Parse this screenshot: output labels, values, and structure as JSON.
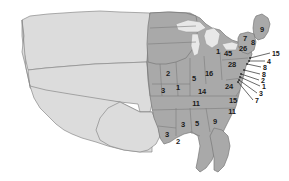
{
  "figure": {
    "type": "choropleth-style outline map",
    "colors": {
      "unlabeled_region_fill": "#dcdcdc",
      "labeled_region_fill": "#a9a9a9",
      "lake_fill": "#e8e8e8",
      "border_stroke": "#787878",
      "outline_stroke": "#6b6b6b",
      "label_text": "#1b1b1b",
      "leader_line": "#2a2a2a",
      "background": "#ffffff"
    }
  },
  "chart_data": {
    "type": "map",
    "title": "",
    "xlabel": "",
    "ylabel": "",
    "legend_position": "none",
    "grid": false,
    "value_label": "count",
    "regions": [
      {
        "name": "midwest-upper",
        "value": "2",
        "x": 168,
        "y": 74
      },
      {
        "name": "plains-lower",
        "value": "3",
        "x": 163,
        "y": 91
      },
      {
        "name": "illinois",
        "value": "1",
        "x": 178,
        "y": 88
      },
      {
        "name": "indiana",
        "value": "5",
        "x": 194,
        "y": 79
      },
      {
        "name": "ohio",
        "value": "16",
        "x": 209,
        "y": 74
      },
      {
        "name": "kentucky",
        "value": "14",
        "x": 202,
        "y": 92
      },
      {
        "name": "tennessee",
        "value": "11",
        "x": 196,
        "y": 104
      },
      {
        "name": "virginia",
        "value": "24",
        "x": 229,
        "y": 87
      },
      {
        "name": "pennsylvania",
        "value": "28",
        "x": 232,
        "y": 65
      },
      {
        "name": "newyork",
        "value": "26",
        "x": 243,
        "y": 49
      },
      {
        "name": "greatlakes-a",
        "value": "1",
        "x": 218,
        "y": 52
      },
      {
        "name": "greatlakes-b",
        "value": "45",
        "x": 228,
        "y": 54
      },
      {
        "name": "northcarolina",
        "value": "15",
        "x": 233,
        "y": 101
      },
      {
        "name": "southcarolina",
        "value": "11",
        "x": 232,
        "y": 112
      },
      {
        "name": "georgia",
        "value": "9",
        "x": 215,
        "y": 122
      },
      {
        "name": "alabama",
        "value": "5",
        "x": 197,
        "y": 124
      },
      {
        "name": "mississippi",
        "value": "3",
        "x": 183,
        "y": 125
      },
      {
        "name": "louisiana",
        "value": "3",
        "x": 167,
        "y": 135
      },
      {
        "name": "gulf-coast",
        "value": "2",
        "x": 178,
        "y": 142
      },
      {
        "name": "maine",
        "value": "9",
        "x": 262,
        "y": 30
      },
      {
        "name": "newhampshire",
        "value": "8",
        "x": 253,
        "y": 43
      },
      {
        "name": "vermont",
        "value": "7",
        "x": 245,
        "y": 39
      }
    ],
    "callouts": [
      {
        "name": "callout-1",
        "value": "15",
        "label_x": 272,
        "label_y": 53,
        "tip_x": 250,
        "tip_y": 58
      },
      {
        "name": "callout-2",
        "value": "4",
        "label_x": 267,
        "label_y": 61,
        "tip_x": 249,
        "tip_y": 61
      },
      {
        "name": "callout-3",
        "value": "8",
        "label_x": 263,
        "label_y": 67,
        "tip_x": 247,
        "tip_y": 64
      },
      {
        "name": "callout-4",
        "value": "8",
        "label_x": 262,
        "label_y": 74,
        "tip_x": 244,
        "tip_y": 70
      },
      {
        "name": "callout-5",
        "value": "2",
        "label_x": 261,
        "label_y": 80,
        "tip_x": 241,
        "tip_y": 74
      },
      {
        "name": "callout-6",
        "value": "1",
        "label_x": 262,
        "label_y": 86,
        "tip_x": 240,
        "tip_y": 77
      },
      {
        "name": "callout-7",
        "value": "3",
        "label_x": 259,
        "label_y": 93,
        "tip_x": 239,
        "tip_y": 80
      },
      {
        "name": "callout-8",
        "value": "7",
        "label_x": 255,
        "label_y": 100,
        "tip_x": 238,
        "tip_y": 82
      }
    ]
  }
}
